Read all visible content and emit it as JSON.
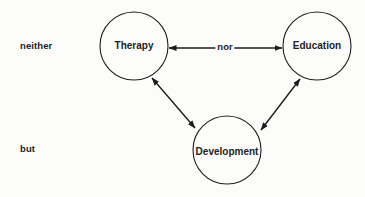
{
  "diagram": {
    "side_labels": {
      "top": "neither",
      "bottom": "but"
    },
    "nodes": [
      {
        "id": "therapy",
        "label": "Therapy",
        "cx": 134,
        "cy": 46,
        "r": 34
      },
      {
        "id": "education",
        "label": "Education",
        "cx": 317,
        "cy": 46,
        "r": 34
      },
      {
        "id": "development",
        "label": "Development",
        "cx": 227,
        "cy": 150,
        "r": 34
      }
    ],
    "edges": [
      {
        "from": "therapy",
        "to": "education",
        "label": "nor",
        "direction": "bidirectional"
      },
      {
        "from": "therapy",
        "to": "development",
        "label": "",
        "direction": "bidirectional"
      },
      {
        "from": "education",
        "to": "development",
        "label": "",
        "direction": "bidirectional"
      }
    ],
    "colors": {
      "line": "#1e1e1e",
      "background": "#fcfcfb"
    }
  }
}
